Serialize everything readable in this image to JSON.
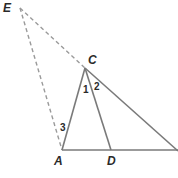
{
  "diagram": {
    "type": "geometry",
    "colors": {
      "solid": "#7a7a7a",
      "dashed": "#9a9a9a",
      "text": "#2a2a2a"
    },
    "points": {
      "E": {
        "label": "E",
        "x": 20,
        "y": 8
      },
      "C": {
        "label": "C",
        "x": 85,
        "y": 68
      },
      "A": {
        "label": "A",
        "x": 62,
        "y": 150
      },
      "D": {
        "label": "D",
        "x": 111,
        "y": 150
      }
    },
    "angle_labels": {
      "a1": "1",
      "a2": "2",
      "a3": "3"
    },
    "segments": {
      "solid": [
        "AC",
        "CD",
        "AD",
        "C-right",
        "A-right"
      ],
      "dashed": [
        "EC",
        "EA"
      ]
    }
  }
}
